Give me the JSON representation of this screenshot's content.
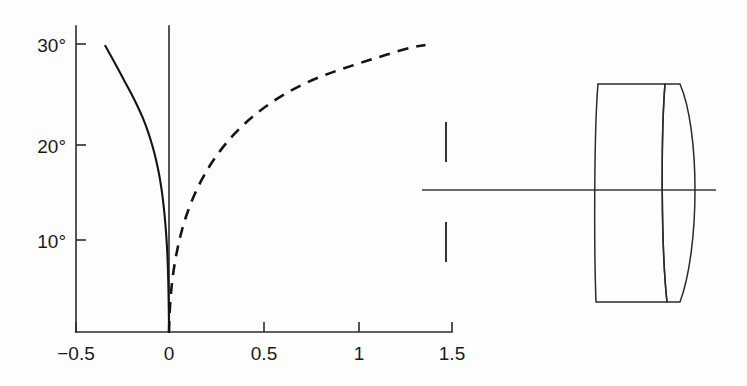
{
  "figure": {
    "background_color": "#fdfdfd",
    "ink_color": "#1a1a1a"
  },
  "chart_data": {
    "type": "line",
    "title": "",
    "subtitle": "",
    "xlabel": "",
    "ylabel": "",
    "xlim": [
      -0.62,
      1.62
    ],
    "ylim": [
      0,
      32
    ],
    "grid": false,
    "legend": "none",
    "x_ticks": [
      -0.5,
      0,
      0.5,
      1,
      1.5
    ],
    "x_tick_labels": [
      "−0.5",
      "0",
      "0.5",
      "1",
      "1.5"
    ],
    "y_ticks": [
      10,
      20,
      30
    ],
    "y_tick_labels": [
      "10°",
      "20°",
      "30°"
    ],
    "series": [
      {
        "name": "solid-curve",
        "style": "solid",
        "x": [
          -0.335,
          -0.318,
          -0.296,
          -0.268,
          -0.236,
          -0.203,
          -0.17,
          -0.14,
          -0.113,
          -0.089,
          -0.069,
          -0.052,
          -0.038,
          -0.027,
          -0.018,
          -0.011,
          -0.006,
          -0.003,
          -0.001,
          0.0
        ],
        "y": [
          29.8,
          29.2,
          28.4,
          27.4,
          26.2,
          25.0,
          23.7,
          22.4,
          21.0,
          19.5,
          18.0,
          16.4,
          14.7,
          12.9,
          11.0,
          9.0,
          6.8,
          4.5,
          2.2,
          0.0
        ]
      },
      {
        "name": "dashed-curve",
        "style": "dashed",
        "x": [
          0.0,
          0.004,
          0.012,
          0.025,
          0.044,
          0.068,
          0.098,
          0.134,
          0.176,
          0.224,
          0.278,
          0.338,
          0.404,
          0.476,
          0.554,
          0.638,
          0.728,
          0.824,
          0.926,
          1.034,
          1.148,
          1.268,
          1.35
        ],
        "y": [
          0.0,
          2.2,
          4.4,
          6.5,
          8.6,
          10.6,
          12.5,
          14.3,
          16.0,
          17.6,
          19.1,
          20.5,
          21.8,
          23.0,
          24.1,
          25.1,
          26.0,
          26.8,
          27.5,
          28.2,
          28.9,
          29.6,
          29.9
        ]
      }
    ]
  },
  "lens_diagram": {
    "name": "cemented-doublet-cross-section",
    "optical_axis": {
      "label": "optical-axis"
    },
    "stop_marks": [
      {
        "label": "upper-field-stop-mark"
      },
      {
        "label": "lower-field-stop-mark"
      }
    ],
    "elements": [
      {
        "label": "front-element",
        "shape": "meniscus"
      },
      {
        "label": "rear-element",
        "shape": "biconvex"
      }
    ]
  }
}
